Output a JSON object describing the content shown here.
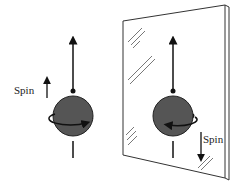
{
  "diagram": {
    "original": {
      "spin_label": "Spin",
      "spin_direction": "up",
      "rotation": "counterclockwise-front-arrow-right"
    },
    "mirror_image": {
      "spin_label": "Spin",
      "spin_direction": "down",
      "rotation": "front-arrow-left"
    },
    "colors": {
      "sphere": "#555555",
      "lines": "#111111",
      "mirror_edge": "#333333"
    }
  }
}
